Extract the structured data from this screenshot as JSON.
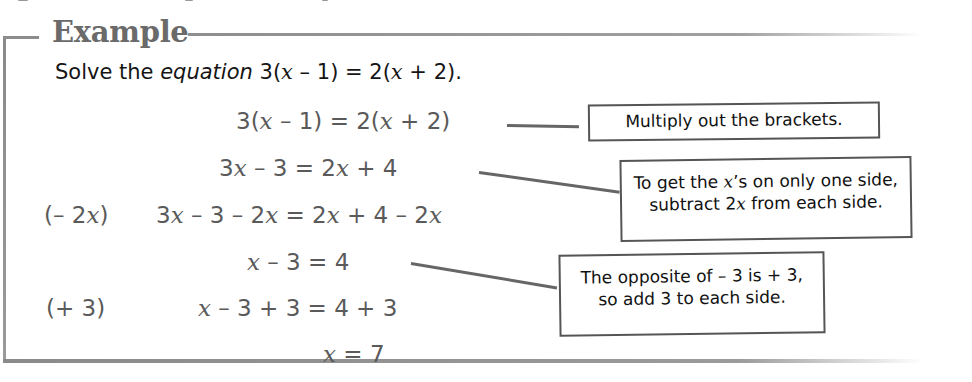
{
  "example": {
    "title": "Example",
    "problem": {
      "prefix": "Solve the ",
      "word_italic": "equation",
      "equation_parts": [
        "3(",
        "x",
        " – 1) = 2(",
        "x",
        " + 2)."
      ]
    },
    "steps": [
      {
        "operation": "",
        "parts": [
          "3(",
          "x",
          " – 1) = 2(",
          "x",
          " + 2)"
        ],
        "plain": "3(x – 1) = 2(x + 2)"
      },
      {
        "operation": "",
        "parts": [
          "3",
          "x",
          " – 3 = 2",
          "x",
          " + 4"
        ],
        "plain": "3x – 3 = 2x + 4"
      },
      {
        "operation_parts": [
          "(– 2",
          "x",
          ")"
        ],
        "operation": "(– 2x)",
        "parts": [
          "3",
          "x",
          " – 3 – 2",
          "x",
          " = 2",
          "x",
          " + 4 – 2",
          "x"
        ],
        "plain": "3x – 3 – 2x = 2x + 4 – 2x"
      },
      {
        "operation": "",
        "parts": [
          "x",
          " – 3 = 4"
        ],
        "plain": "x – 3 = 4"
      },
      {
        "operation": "(+ 3)",
        "parts": [
          "x",
          " – 3 + 3 = 4 + 3"
        ],
        "plain": "x – 3 + 3 = 4 + 3"
      },
      {
        "operation": "",
        "parts": [
          "x",
          " = 7"
        ],
        "plain": "x = 7"
      }
    ],
    "callouts": [
      {
        "lines": [
          "Multiply out the brackets."
        ]
      },
      {
        "line1_parts": [
          "To get the ",
          "x",
          "’s on only one side,"
        ],
        "line2_parts": [
          "subtract 2",
          "x",
          " from each side."
        ]
      },
      {
        "lines": [
          "The opposite of – 3 is + 3,",
          "so add 3 to each side."
        ]
      }
    ]
  },
  "colors": {
    "frame": "#8e8e8e",
    "title": "#6a6a6a",
    "math": "#5a5a5a",
    "callout_border": "#555555",
    "text": "#151515"
  }
}
